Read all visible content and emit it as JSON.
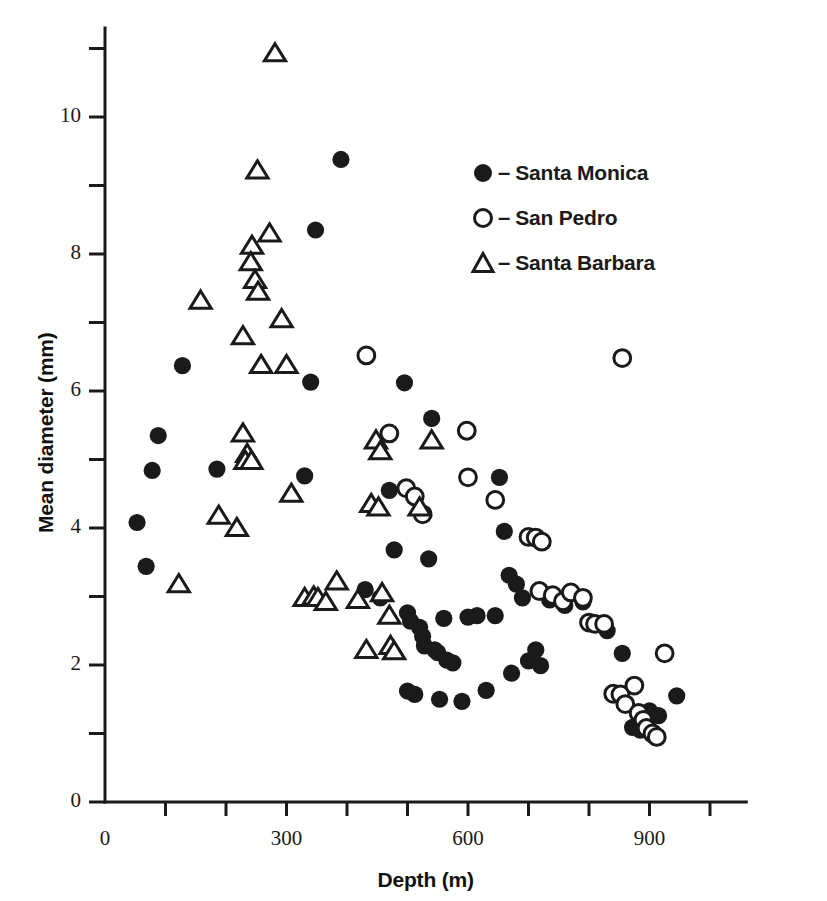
{
  "figure": {
    "background": "#ffffff",
    "ink_color": "#1a1a1a"
  },
  "chart_data": {
    "type": "scatter",
    "title": "",
    "xlabel": "Depth (m)",
    "ylabel": "Mean diameter (mm)",
    "xlim": [
      0,
      1060
    ],
    "ylim": [
      0,
      11.3
    ],
    "grid": false,
    "x_ticks_major": [
      0,
      300,
      600,
      900
    ],
    "x_ticks_minor": [
      100,
      200,
      400,
      500,
      700,
      800,
      1000
    ],
    "x_tick_labels": [
      "0",
      "300",
      "600",
      "900"
    ],
    "y_ticks_major": [
      0,
      2,
      4,
      6,
      8,
      10
    ],
    "y_ticks_minor": [
      1,
      3,
      5,
      7,
      9,
      11
    ],
    "y_tick_labels": [
      "0",
      "2",
      "4",
      "6",
      "8",
      "10"
    ],
    "legend_position": "upper-right-inside",
    "series": [
      {
        "name": "Santa Monica",
        "marker": "filled-circle",
        "color": "#1a1a1a",
        "points": [
          [
            53,
            4.08
          ],
          [
            68,
            3.44
          ],
          [
            78,
            4.84
          ],
          [
            88,
            5.35
          ],
          [
            128,
            6.37
          ],
          [
            185,
            4.86
          ],
          [
            340,
            6.13
          ],
          [
            348,
            8.35
          ],
          [
            330,
            4.76
          ],
          [
            390,
            9.38
          ],
          [
            430,
            3.1
          ],
          [
            455,
            2.98
          ],
          [
            470,
            4.55
          ],
          [
            478,
            3.68
          ],
          [
            495,
            6.12
          ],
          [
            500,
            2.76
          ],
          [
            505,
            2.64
          ],
          [
            500,
            1.62
          ],
          [
            512,
            1.57
          ],
          [
            520,
            2.55
          ],
          [
            525,
            2.42
          ],
          [
            528,
            2.28
          ],
          [
            535,
            3.55
          ],
          [
            540,
            5.6
          ],
          [
            545,
            2.22
          ],
          [
            550,
            2.18
          ],
          [
            553,
            1.5
          ],
          [
            560,
            2.68
          ],
          [
            565,
            2.07
          ],
          [
            575,
            2.03
          ],
          [
            590,
            1.47
          ],
          [
            600,
            2.7
          ],
          [
            615,
            2.72
          ],
          [
            630,
            1.63
          ],
          [
            645,
            2.72
          ],
          [
            652,
            4.74
          ],
          [
            660,
            3.95
          ],
          [
            668,
            3.31
          ],
          [
            672,
            1.88
          ],
          [
            680,
            3.18
          ],
          [
            690,
            2.98
          ],
          [
            700,
            2.06
          ],
          [
            712,
            2.22
          ],
          [
            720,
            1.99
          ],
          [
            735,
            2.95
          ],
          [
            760,
            2.87
          ],
          [
            790,
            2.92
          ],
          [
            805,
            2.62
          ],
          [
            830,
            2.5
          ],
          [
            840,
            1.58
          ],
          [
            855,
            2.17
          ],
          [
            872,
            1.09
          ],
          [
            885,
            1.05
          ],
          [
            900,
            1.33
          ],
          [
            915,
            1.26
          ],
          [
            945,
            1.55
          ]
        ]
      },
      {
        "name": "San Pedro",
        "marker": "open-circle",
        "color": "#1a1a1a",
        "points": [
          [
            432,
            6.52
          ],
          [
            470,
            5.38
          ],
          [
            498,
            4.58
          ],
          [
            512,
            4.46
          ],
          [
            525,
            4.2
          ],
          [
            598,
            5.42
          ],
          [
            600,
            4.74
          ],
          [
            645,
            4.41
          ],
          [
            700,
            3.87
          ],
          [
            712,
            3.86
          ],
          [
            722,
            3.8
          ],
          [
            718,
            3.08
          ],
          [
            740,
            3.02
          ],
          [
            757,
            2.93
          ],
          [
            770,
            3.06
          ],
          [
            790,
            2.98
          ],
          [
            800,
            2.62
          ],
          [
            810,
            2.6
          ],
          [
            825,
            2.6
          ],
          [
            855,
            6.48
          ],
          [
            840,
            1.58
          ],
          [
            852,
            1.57
          ],
          [
            860,
            1.43
          ],
          [
            875,
            1.7
          ],
          [
            882,
            1.3
          ],
          [
            890,
            1.2
          ],
          [
            895,
            1.08
          ],
          [
            905,
            1.0
          ],
          [
            912,
            0.95
          ],
          [
            925,
            2.17
          ]
        ]
      },
      {
        "name": "Santa Barbara",
        "marker": "open-triangle",
        "color": "#1a1a1a",
        "points": [
          [
            281,
            10.93
          ],
          [
            252,
            9.22
          ],
          [
            272,
            8.3
          ],
          [
            243,
            8.12
          ],
          [
            241,
            7.88
          ],
          [
            248,
            7.62
          ],
          [
            253,
            7.45
          ],
          [
            158,
            7.32
          ],
          [
            228,
            6.8
          ],
          [
            292,
            7.05
          ],
          [
            258,
            6.38
          ],
          [
            300,
            6.38
          ],
          [
            122,
            3.18
          ],
          [
            188,
            4.18
          ],
          [
            218,
            4.0
          ],
          [
            228,
            5.38
          ],
          [
            235,
            5.08
          ],
          [
            232,
            4.98
          ],
          [
            242,
            4.98
          ],
          [
            308,
            4.5
          ],
          [
            330,
            2.98
          ],
          [
            345,
            3.0
          ],
          [
            352,
            2.98
          ],
          [
            365,
            2.92
          ],
          [
            383,
            3.22
          ],
          [
            418,
            2.95
          ],
          [
            432,
            2.22
          ],
          [
            440,
            4.35
          ],
          [
            452,
            4.3
          ],
          [
            458,
            3.05
          ],
          [
            470,
            2.72
          ],
          [
            448,
            5.28
          ],
          [
            455,
            5.12
          ],
          [
            472,
            2.28
          ],
          [
            478,
            2.2
          ],
          [
            520,
            4.3
          ],
          [
            540,
            5.28
          ]
        ]
      }
    ]
  },
  "legend": {
    "dash": "–",
    "items": [
      {
        "symbol": "filled-circle",
        "label": "Santa Monica"
      },
      {
        "symbol": "open-circle",
        "label": "San Pedro"
      },
      {
        "symbol": "open-triangle",
        "label": "Santa Barbara"
      }
    ]
  }
}
